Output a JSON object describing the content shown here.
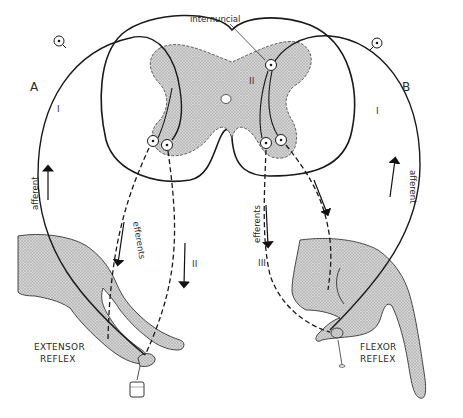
{
  "diagram": {
    "panels": {
      "A": {
        "letter": "A",
        "caption_line1": "EXTENSOR",
        "caption_line2": "REFLEX",
        "afferent_label": "afferent",
        "afferent_neuron_number": "I",
        "efferents_label": "efferents",
        "efferent_neuron_number": "II",
        "stimulus": "weight"
      },
      "B": {
        "letter": "B",
        "caption_line1": "FLEXOR",
        "caption_line2": "REFLEX",
        "afferent_label": "afferent",
        "afferent_neuron_number": "I",
        "internuncial_neuron_number": "II",
        "efferents_label": "efferents",
        "efferent_neuron_number": "III",
        "stimulus": "pin"
      }
    },
    "internuncial_label": "internuncial",
    "colors": {
      "line": "#1a1a1a",
      "gray_matter": "#c8c8c8",
      "limb_fill": "#b9b9b9",
      "background": "#ffffff"
    }
  }
}
